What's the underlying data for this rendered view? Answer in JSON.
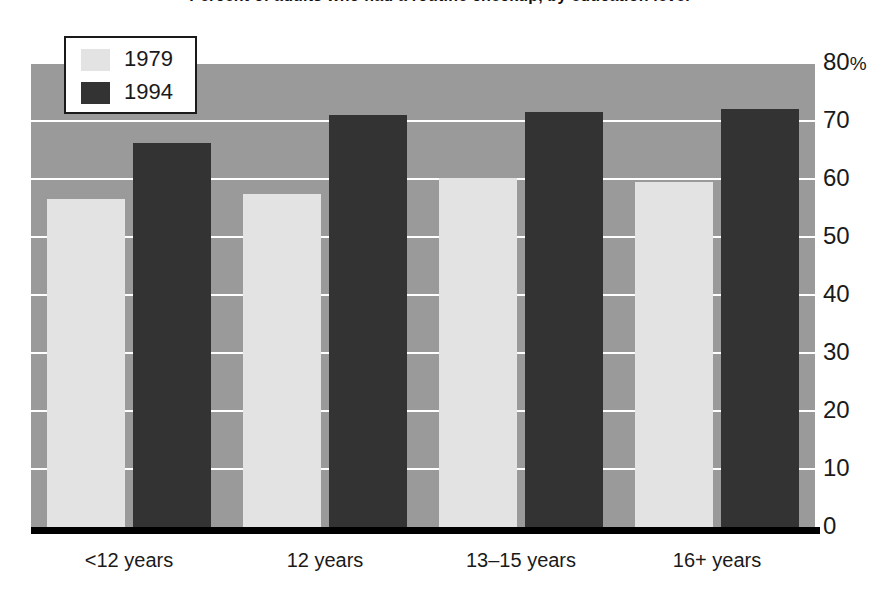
{
  "chart_data": {
    "type": "bar",
    "title": "Percent of adults who had a routine checkup, by education level",
    "xlabel": "",
    "ylabel": "",
    "ylim": [
      0,
      80
    ],
    "grid": true,
    "legend_position": "top-left",
    "categories": [
      "<12 years",
      "12 years",
      "13–15 years",
      "16+ years"
    ],
    "series": [
      {
        "name": "1979",
        "color": "#e3e3e3",
        "values": [
          56.6,
          57.4,
          60.2,
          59.5
        ]
      },
      {
        "name": "1994",
        "color": "#333333",
        "values": [
          66.2,
          71.0,
          71.5,
          72.0
        ]
      }
    ],
    "yticks": [
      {
        "value": 80,
        "label": "80",
        "suffix": "%"
      },
      {
        "value": 70,
        "label": "70",
        "suffix": ""
      },
      {
        "value": 60,
        "label": "60",
        "suffix": ""
      },
      {
        "value": 50,
        "label": "50",
        "suffix": ""
      },
      {
        "value": 40,
        "label": "40",
        "suffix": ""
      },
      {
        "value": 30,
        "label": "30",
        "suffix": ""
      },
      {
        "value": 20,
        "label": "20",
        "suffix": ""
      },
      {
        "value": 10,
        "label": "10",
        "suffix": ""
      },
      {
        "value": 0,
        "label": "0",
        "suffix": ""
      }
    ],
    "colors": {
      "plot_background": "#9a9a9a",
      "gridline": "#ffffff",
      "axis": "#000000",
      "text": "#1a1a1a",
      "page_background": "#ffffff"
    }
  }
}
